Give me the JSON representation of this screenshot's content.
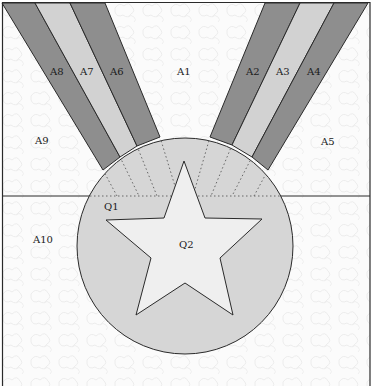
{
  "diagram": {
    "type": "quilt-pattern",
    "colors": {
      "background": "#fbfbfb",
      "texture": "#ececec",
      "band_dark": "#8e8e8e",
      "band_light": "#d2d2d2",
      "medallion": "#d6d6d6",
      "star": "#efefef",
      "outline": "#2a2a2a",
      "dotted": "#666666"
    },
    "labels": {
      "a1": "A1",
      "a2": "A2",
      "a3": "A3",
      "a4": "A4",
      "a5": "A5",
      "a6": "A6",
      "a7": "A7",
      "a8": "A8",
      "a9": "A9",
      "a10": "A10",
      "q1": "Q1",
      "q2": "Q2"
    },
    "regions": [
      {
        "id": "A1",
        "description": "top center background between ribbon groups"
      },
      {
        "id": "A2",
        "description": "right ribbon, inner dark band"
      },
      {
        "id": "A3",
        "description": "right ribbon, middle light band"
      },
      {
        "id": "A4",
        "description": "right ribbon, outer dark band"
      },
      {
        "id": "A5",
        "description": "top right background"
      },
      {
        "id": "A6",
        "description": "left ribbon, inner dark band"
      },
      {
        "id": "A7",
        "description": "left ribbon, middle light band"
      },
      {
        "id": "A8",
        "description": "left ribbon, outer dark band"
      },
      {
        "id": "A9",
        "description": "top left background"
      },
      {
        "id": "A10",
        "description": "lower background around medallion"
      },
      {
        "id": "Q1",
        "description": "circular medallion"
      },
      {
        "id": "Q2",
        "description": "five-point star inside medallion"
      }
    ]
  }
}
